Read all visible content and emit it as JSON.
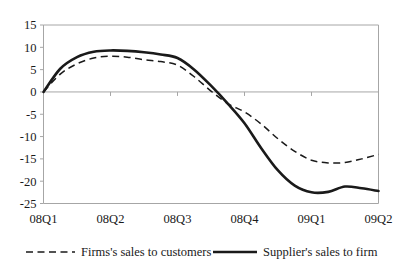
{
  "chart_data": {
    "type": "line",
    "title": "",
    "subtitle": "",
    "xlabel": "",
    "ylabel": "",
    "categories": [
      "08Q1",
      "08Q2",
      "08Q3",
      "08Q4",
      "09Q1",
      "09Q2"
    ],
    "x": [
      0,
      1,
      2,
      3,
      4,
      5
    ],
    "ylim": [
      -25,
      15
    ],
    "yticks": [
      15,
      10,
      5,
      0,
      -5,
      -10,
      -15,
      -20,
      -25
    ],
    "ytick_labels": [
      "15",
      "10",
      "5",
      "0",
      "-5",
      "-10",
      "-15",
      "-20",
      "-25"
    ],
    "grid": false,
    "zero_line": true,
    "legend_position": "bottom",
    "series": [
      {
        "name": "Firms's sales to customers",
        "style": "dashed",
        "color": "#1a1a1a",
        "values": [
          0,
          8.0,
          6.0,
          -4.5,
          -15.3,
          -14.0
        ],
        "points": [
          [
            0.0,
            0.0
          ],
          [
            0.25,
            4.0
          ],
          [
            0.5,
            6.3
          ],
          [
            0.75,
            7.6
          ],
          [
            1.0,
            8.0
          ],
          [
            1.25,
            7.8
          ],
          [
            1.5,
            7.2
          ],
          [
            1.75,
            6.8
          ],
          [
            2.0,
            6.0
          ],
          [
            2.25,
            3.4
          ],
          [
            2.5,
            0.2
          ],
          [
            2.75,
            -2.6
          ],
          [
            3.0,
            -4.5
          ],
          [
            3.25,
            -7.2
          ],
          [
            3.5,
            -10.5
          ],
          [
            3.75,
            -13.3
          ],
          [
            4.0,
            -15.3
          ],
          [
            4.25,
            -15.9
          ],
          [
            4.5,
            -15.8
          ],
          [
            4.75,
            -15.0
          ],
          [
            5.0,
            -14.0
          ]
        ]
      },
      {
        "name": "Supplier's sales to firm",
        "style": "solid",
        "color": "#1a1a1a",
        "values": [
          0,
          9.3,
          7.6,
          -7.0,
          -21.2,
          -22.2
        ],
        "points": [
          [
            0.0,
            0.0
          ],
          [
            0.25,
            5.2
          ],
          [
            0.5,
            7.8
          ],
          [
            0.75,
            9.0
          ],
          [
            1.0,
            9.3
          ],
          [
            1.25,
            9.2
          ],
          [
            1.5,
            8.9
          ],
          [
            1.75,
            8.4
          ],
          [
            2.0,
            7.6
          ],
          [
            2.25,
            5.0
          ],
          [
            2.5,
            1.4
          ],
          [
            2.75,
            -2.6
          ],
          [
            3.0,
            -7.0
          ],
          [
            3.25,
            -12.6
          ],
          [
            3.5,
            -17.6
          ],
          [
            3.75,
            -21.0
          ],
          [
            4.0,
            -22.5
          ],
          [
            4.25,
            -22.4
          ],
          [
            4.5,
            -21.2
          ],
          [
            4.75,
            -21.6
          ],
          [
            5.0,
            -22.2
          ]
        ]
      }
    ],
    "legend": [
      {
        "label": "Firms's sales to customers",
        "style": "dashed"
      },
      {
        "label": "Supplier's sales to firm",
        "style": "solid"
      }
    ]
  },
  "axis": {
    "y_labels": [
      "15",
      "10",
      "5",
      "0",
      "-5",
      "-10",
      "-15",
      "-20",
      "-25"
    ],
    "x_labels": [
      "08Q1",
      "08Q2",
      "08Q3",
      "08Q4",
      "09Q1",
      "09Q2"
    ]
  },
  "legend": {
    "items": [
      {
        "label": "Firms's sales to customers"
      },
      {
        "label": "Supplier's sales to firm"
      }
    ]
  }
}
